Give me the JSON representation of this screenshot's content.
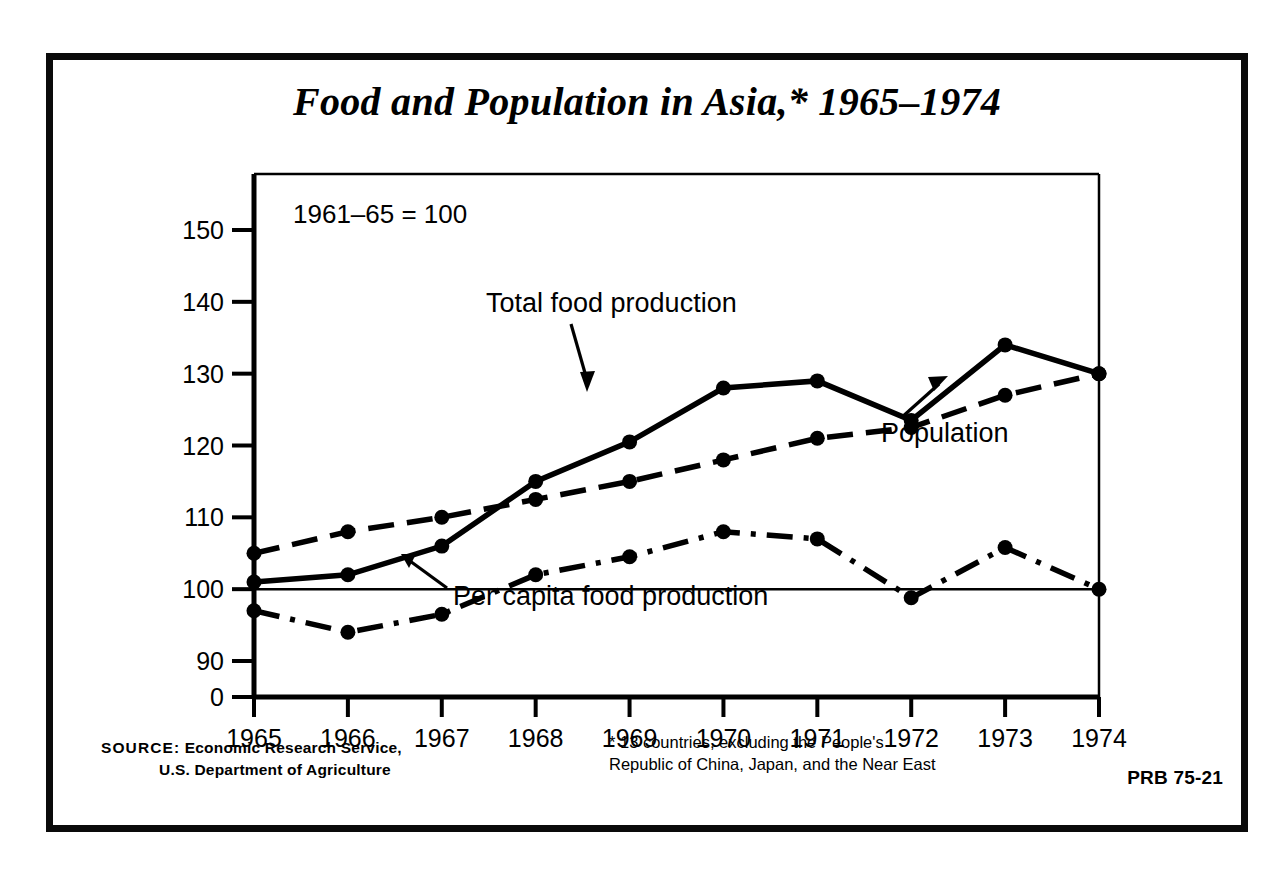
{
  "title": "Food and Population in Asia,* 1965–1974",
  "index_note": "1961–65 = 100",
  "source": {
    "lead": "SOURCE:",
    "line1": " Economic Research Service,",
    "line2": "U.S. Department of Agriculture"
  },
  "footnote": "* 13 countries, excluding the People's Republic of China, Japan, and the Near East",
  "publication_code": "PRB 75-21",
  "labels": {
    "total_food": "Total food production",
    "population": "Population",
    "per_capita": "Per capita food production"
  },
  "chart_data": {
    "type": "line",
    "title": "Food and Population in Asia,* 1965–1974",
    "subtitle": "1961–65 = 100",
    "xlabel": "",
    "ylabel": "",
    "x": [
      1965,
      1966,
      1967,
      1968,
      1969,
      1970,
      1971,
      1972,
      1973,
      1974
    ],
    "categories": [
      "1965",
      "1966",
      "1967",
      "1968",
      "1969",
      "1970",
      "1971",
      "1972",
      "1973",
      "1974"
    ],
    "ytick_labels": [
      "0",
      "90",
      "100",
      "110",
      "120",
      "130",
      "140",
      "150"
    ],
    "ytick_values": [
      0,
      90,
      100,
      110,
      120,
      130,
      140,
      150
    ],
    "ylim": [
      90,
      150
    ],
    "axis_break": true,
    "grid": false,
    "reference_line": 100,
    "legend_position": "inline-annotations",
    "series": [
      {
        "name": "Total food production",
        "style": "solid",
        "values": [
          101,
          102,
          106,
          115,
          120.5,
          128,
          129,
          123.5,
          134,
          130
        ]
      },
      {
        "name": "Population",
        "style": "dashed",
        "values": [
          105,
          108,
          110,
          112.5,
          115,
          118,
          121,
          122.5,
          127,
          130
        ]
      },
      {
        "name": "Per capita food production",
        "style": "dash-dot",
        "values": [
          97,
          94,
          96.5,
          102,
          104.5,
          108,
          107,
          98.8,
          105.8,
          100
        ]
      }
    ]
  }
}
